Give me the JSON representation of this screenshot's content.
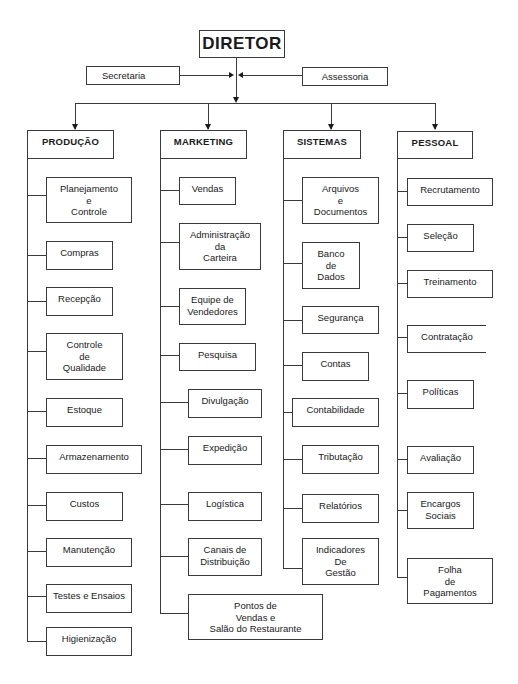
{
  "chart": {
    "root": "DIRETOR",
    "staff": {
      "left": "Secretaria",
      "right": "Assessoria"
    },
    "departments": [
      {
        "name": "PRODUÇÃO",
        "units": [
          "Planejamento\ne\nControle",
          "Compras",
          "Recepção",
          "Controle\nde\nQualidade",
          "Estoque",
          "Armazenamento",
          "Custos",
          "Manutenção",
          "Testes e Ensaios",
          "Higienização"
        ]
      },
      {
        "name": "MARKETING",
        "units": [
          "Vendas",
          "Administração\nda\nCarteira",
          "Equipe de\nVendedores",
          "Pesquisa",
          "Divulgação",
          "Expedição",
          "Logística",
          "Canais de\nDistribuição",
          "Pontos de\nVendas e\nSalão do Restaurante"
        ]
      },
      {
        "name": "SISTEMAS",
        "units": [
          "Arquivos\ne\nDocumentos",
          "Banco\nde\nDados",
          "Segurança",
          "Contas",
          "Contabilidade",
          "Tributação",
          "Relatórios",
          "Indicadores\nDe\nGestão"
        ]
      },
      {
        "name": "PESSOAL",
        "units": [
          "Recrutamento",
          "Seleção",
          "Treinamento",
          "Contratação",
          "Políticas",
          "Avaliação",
          "Encargos\nSociais",
          "Folha\nde\nPagamentos"
        ]
      }
    ]
  },
  "colors": {
    "line": "#3a3a3a",
    "text": "#1a1a1a",
    "background": "#ffffff"
  }
}
